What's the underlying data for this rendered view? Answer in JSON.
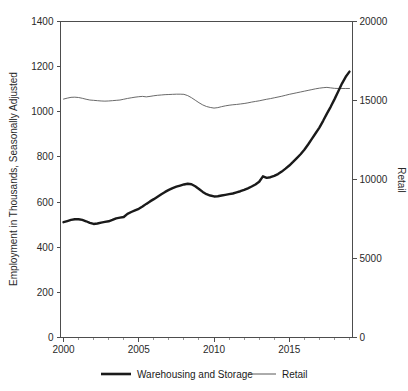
{
  "chart_data": {
    "type": "line",
    "title": "",
    "xlabel": "",
    "ylabel": "Employment in Thousands, Seasonally Adjusted",
    "y2label": "Retail",
    "grid": false,
    "legend_position": "bottom",
    "xlim": [
      1999.8,
      2019.2
    ],
    "ylim": [
      0,
      1400
    ],
    "y2lim": [
      0,
      20000
    ],
    "xticks": [
      2000,
      2005,
      2010,
      2015
    ],
    "xtick_labels": [
      "2000",
      "2005",
      "2010",
      "2015"
    ],
    "xminor_ticks": [
      2001,
      2002,
      2003,
      2004,
      2006,
      2007,
      2008,
      2009,
      2011,
      2012,
      2013,
      2014,
      2016,
      2017,
      2018,
      2019
    ],
    "yticks": [
      0,
      200,
      400,
      600,
      800,
      1000,
      1200,
      1400
    ],
    "ytick_labels": [
      "0",
      "200",
      "400",
      "600",
      "800",
      "1000",
      "1200",
      "1400"
    ],
    "y2ticks": [
      0,
      5000,
      10000,
      15000,
      20000
    ],
    "y2tick_labels": [
      "0",
      "5000",
      "10000",
      "15000",
      "20000"
    ],
    "x": [
      2000.0,
      2000.25,
      2000.5,
      2000.75,
      2001.0,
      2001.25,
      2001.5,
      2001.75,
      2002.0,
      2002.25,
      2002.5,
      2002.75,
      2003.0,
      2003.25,
      2003.5,
      2003.75,
      2004.0,
      2004.25,
      2004.5,
      2004.75,
      2005.0,
      2005.25,
      2005.5,
      2005.75,
      2006.0,
      2006.25,
      2006.5,
      2006.75,
      2007.0,
      2007.25,
      2007.5,
      2007.75,
      2008.0,
      2008.25,
      2008.5,
      2008.75,
      2009.0,
      2009.25,
      2009.5,
      2009.75,
      2010.0,
      2010.25,
      2010.5,
      2010.75,
      2011.0,
      2011.25,
      2011.5,
      2011.75,
      2012.0,
      2012.25,
      2012.5,
      2012.75,
      2013.0,
      2013.25,
      2013.5,
      2013.75,
      2014.0,
      2014.25,
      2014.5,
      2014.75,
      2015.0,
      2015.25,
      2015.5,
      2015.75,
      2016.0,
      2016.25,
      2016.5,
      2016.75,
      2017.0,
      2017.25,
      2017.5,
      2017.75,
      2018.0,
      2018.25,
      2018.5,
      2018.75,
      2019.0
    ],
    "series": [
      {
        "name": "Warehousing and Storage",
        "axis": "left",
        "style": "thick",
        "color": "#1a1a1a",
        "units": "Thousands of employees",
        "values": [
          511,
          516,
          521,
          524,
          524,
          521,
          515,
          508,
          503,
          505,
          509,
          512,
          515,
          521,
          528,
          531,
          534,
          548,
          556,
          563,
          570,
          580,
          592,
          603,
          613,
          624,
          635,
          645,
          654,
          662,
          668,
          673,
          678,
          681,
          679,
          670,
          658,
          645,
          635,
          629,
          625,
          626,
          629,
          632,
          635,
          638,
          643,
          648,
          654,
          661,
          669,
          678,
          690,
          714,
          707,
          710,
          716,
          724,
          735,
          748,
          762,
          778,
          795,
          812,
          832,
          855,
          880,
          905,
          930,
          960,
          992,
          1022,
          1055,
          1090,
          1125,
          1155,
          1178
        ]
      },
      {
        "name": "Retail",
        "axis": "right",
        "style": "thin",
        "color": "#595959",
        "units": "Thousands of employees",
        "values": [
          15090,
          15150,
          15200,
          15210,
          15190,
          15140,
          15080,
          15030,
          15010,
          14990,
          14970,
          14960,
          14970,
          14990,
          15010,
          15030,
          15080,
          15130,
          15170,
          15210,
          15240,
          15260,
          15230,
          15260,
          15300,
          15330,
          15350,
          15370,
          15380,
          15390,
          15400,
          15400,
          15390,
          15310,
          15180,
          15020,
          14860,
          14720,
          14620,
          14560,
          14520,
          14550,
          14610,
          14660,
          14700,
          14730,
          14750,
          14780,
          14810,
          14850,
          14900,
          14940,
          14980,
          15030,
          15080,
          15120,
          15170,
          15220,
          15270,
          15330,
          15390,
          15440,
          15490,
          15540,
          15590,
          15640,
          15690,
          15740,
          15780,
          15810,
          15830,
          15800,
          15770,
          15760,
          15760,
          15760,
          15760
        ]
      }
    ]
  },
  "legend": {
    "items": [
      {
        "label": "Warehousing and Storage",
        "style": "thick"
      },
      {
        "label": "Retail",
        "style": "thin"
      }
    ]
  },
  "axes": {
    "left_title": "Employment in Thousands, Seasonally Adjusted",
    "right_title": "Retail"
  }
}
